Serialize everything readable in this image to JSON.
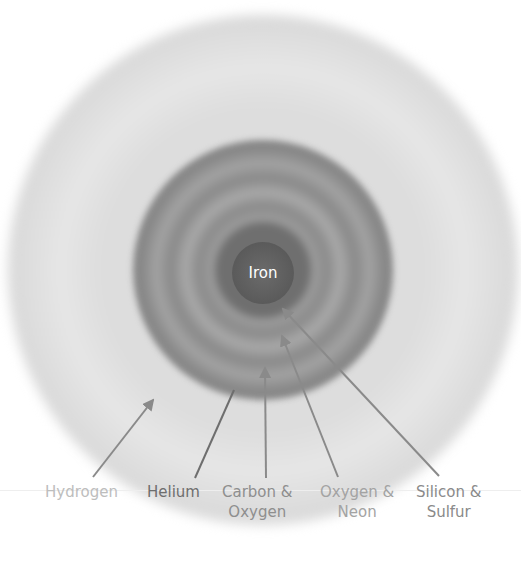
{
  "diagram": {
    "title": "",
    "center_label": "Iron",
    "layers": [
      {
        "id": "hydrogen",
        "label": "Hydrogen",
        "color": "#bdbdbd"
      },
      {
        "id": "helium",
        "label": "Helium",
        "color": "#6e6e6e"
      },
      {
        "id": "carbon-oxygen",
        "label_line1": "Carbon &",
        "label_line2": "Oxygen",
        "color": "#8e8e8e"
      },
      {
        "id": "oxygen-neon",
        "label_line1": "Oxygen &",
        "label_line2": "Neon",
        "color": "#a3a3a3"
      },
      {
        "id": "silicon-sulfur",
        "label_line1": "Silicon &",
        "label_line2": "Sulfur",
        "color": "#8a8a8a"
      }
    ],
    "arrow_color": "#7a7a7a"
  }
}
